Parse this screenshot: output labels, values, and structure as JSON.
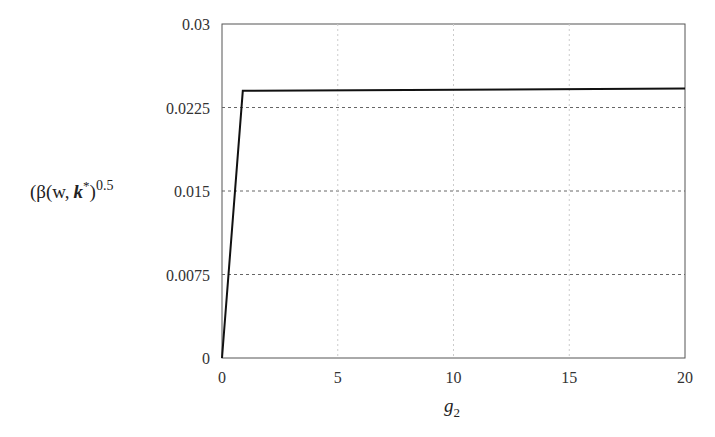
{
  "chart_data": {
    "type": "line",
    "title": "",
    "xlabel": "g2",
    "xlabel_main": "g",
    "xlabel_sub": "2",
    "ylabel": "(β(w, k*)^0.5",
    "ylabel_parts": {
      "open": "(β(w,",
      "k": "k",
      "star": "*",
      "close": ")",
      "exp": "0.5"
    },
    "xlim": [
      0,
      20
    ],
    "ylim": [
      0,
      0.03
    ],
    "x_ticks": [
      "0",
      "5",
      "10",
      "15",
      "20"
    ],
    "y_ticks": [
      "0",
      "0.0075",
      "0.015",
      "0.0225",
      "0.03"
    ],
    "grid": {
      "horizontal": "dashed",
      "vertical": "dotted-light"
    },
    "legend": null,
    "series": [
      {
        "name": "(β(w,k*))^0.5",
        "x": [
          0,
          0.9,
          20
        ],
        "y": [
          0,
          0.024,
          0.0242
        ]
      }
    ]
  }
}
